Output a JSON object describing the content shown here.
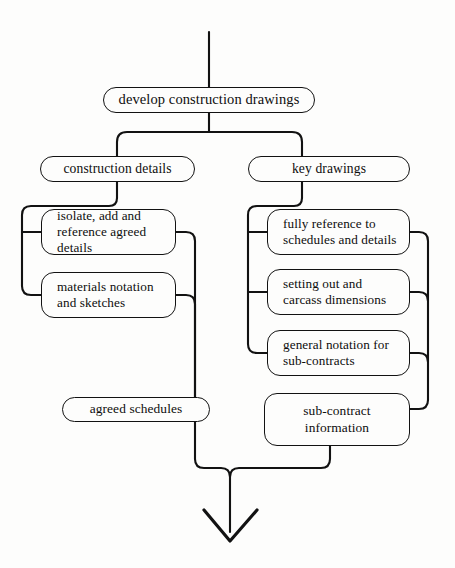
{
  "diagram": {
    "type": "flowchart",
    "background_color": "#fdfdfc",
    "line_color": "#121212",
    "text_color": "#0d0d0d"
  },
  "nodes": {
    "root": {
      "label": "develop construction drawings"
    },
    "branch_left": {
      "label": "construction  details"
    },
    "branch_right": {
      "label": "key drawings"
    },
    "left_1_line1": "isolate, add and",
    "left_1_line2": "reference agreed details",
    "left_2_line1": "materials notation",
    "left_2_line2": "and sketches",
    "right_1_line1": "fully reference to",
    "right_1_line2": "schedules and details",
    "right_2_line1": "setting out and",
    "right_2_line2": "carcass dimensions",
    "right_3_line1": "general notation for",
    "right_3_line2": "sub-contracts",
    "out_left": {
      "label": "agreed schedules"
    },
    "out_right_line1": "sub-contract",
    "out_right_line2": "information"
  },
  "connectors": {
    "inflow_label": "input flow line",
    "outflow_label": "output flow arrow"
  }
}
